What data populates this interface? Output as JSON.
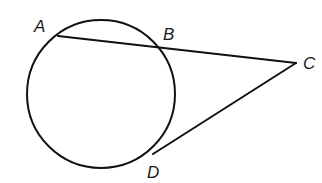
{
  "diagram": {
    "points": {
      "A": {
        "label": "A"
      },
      "B": {
        "label": "B"
      },
      "C": {
        "label": "C"
      },
      "D": {
        "label": "D"
      }
    },
    "segments": [
      {
        "name": "secant-AC",
        "from": "A",
        "to": "C"
      },
      {
        "name": "tangent-CD",
        "from": "C",
        "to": "D"
      }
    ],
    "colors": {
      "stroke": "#111111",
      "background": "#ffffff"
    }
  }
}
